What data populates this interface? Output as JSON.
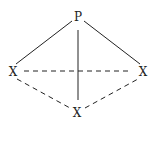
{
  "diagram": {
    "type": "tetrahedral-geometry",
    "nodes": [
      {
        "id": "P",
        "label": "P",
        "x": 78,
        "y": 17
      },
      {
        "id": "XL",
        "label": "X",
        "x": 13,
        "y": 72
      },
      {
        "id": "XR",
        "label": "X",
        "x": 143,
        "y": 72
      },
      {
        "id": "XB",
        "label": "X",
        "x": 77,
        "y": 113
      }
    ],
    "edges": [
      {
        "from": "P",
        "to": "XL",
        "style": "solid"
      },
      {
        "from": "P",
        "to": "XR",
        "style": "solid"
      },
      {
        "from": "P",
        "to": "XB",
        "style": "solid"
      },
      {
        "from": "XL",
        "to": "XR",
        "style": "dashed"
      },
      {
        "from": "XL",
        "to": "XB",
        "style": "dashed"
      },
      {
        "from": "XB",
        "to": "XR",
        "style": "dashed"
      }
    ],
    "colors": {
      "line": "#222222",
      "background": "#ffffff"
    }
  }
}
